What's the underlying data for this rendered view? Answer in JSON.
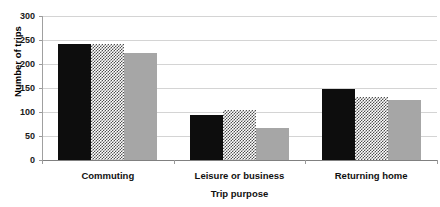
{
  "chart_data": {
    "type": "bar",
    "title": "",
    "xlabel": "Trip purpose",
    "ylabel": "Number of trips",
    "categories": [
      "Commuting",
      "Leisure or business",
      "Returning home"
    ],
    "series": [
      {
        "name": "series-1",
        "fill": "solid-black",
        "color": "#0d0d0d",
        "values": [
          242,
          94,
          148
        ]
      },
      {
        "name": "series-2",
        "fill": "checker",
        "color": "#4f4f4f",
        "values": [
          242,
          104,
          131
        ]
      },
      {
        "name": "series-3",
        "fill": "solid-gray",
        "color": "#a6a6a6",
        "values": [
          223,
          67,
          125
        ]
      }
    ],
    "ylim": [
      0,
      300
    ],
    "yticks": [
      300,
      250,
      200,
      150,
      100,
      50,
      0
    ],
    "grid": true,
    "legend": "none"
  },
  "axis": {
    "y_title": "Number of trips",
    "x_title": "Trip purpose",
    "y_tick_labels": [
      "300",
      "250",
      "200",
      "150",
      "100",
      "50",
      "0"
    ]
  }
}
